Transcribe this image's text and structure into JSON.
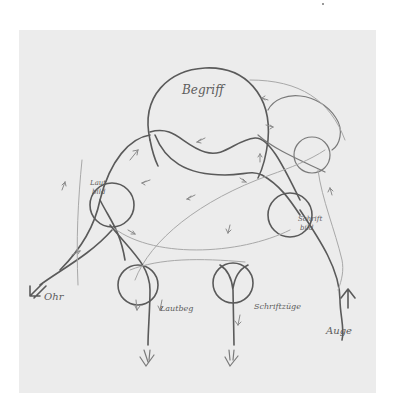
{
  "diagram": {
    "type": "hand-drawn pencil sketch",
    "paper_color": "#ececec",
    "ink_color": "#5a5a5a",
    "nodes": [
      {
        "id": "begriff",
        "label": "Begriff",
        "shape": "large circle"
      },
      {
        "id": "lautbild",
        "label_line1": "Laut",
        "label_line2": "bild",
        "shape": "small circle"
      },
      {
        "id": "schriftbild",
        "label_line1": "Schrift",
        "label_line2": "bild",
        "shape": "small circle"
      },
      {
        "id": "top-right-circle",
        "label": "",
        "shape": "small circle"
      },
      {
        "id": "lautbewegung",
        "label": "Lautbeg",
        "shape": "small circle"
      },
      {
        "id": "schriftzuege",
        "label": "Schriftzüge",
        "shape": "small circle"
      }
    ],
    "inputs": [
      {
        "id": "ohr",
        "label": "Ohr",
        "arrow": "inbound diagonal"
      },
      {
        "id": "auge",
        "label": "Auge",
        "arrow": "inbound upward"
      }
    ],
    "outputs": [
      {
        "id": "out-left",
        "arrow": "double downward"
      },
      {
        "id": "out-right",
        "arrow": "double downward"
      }
    ]
  }
}
